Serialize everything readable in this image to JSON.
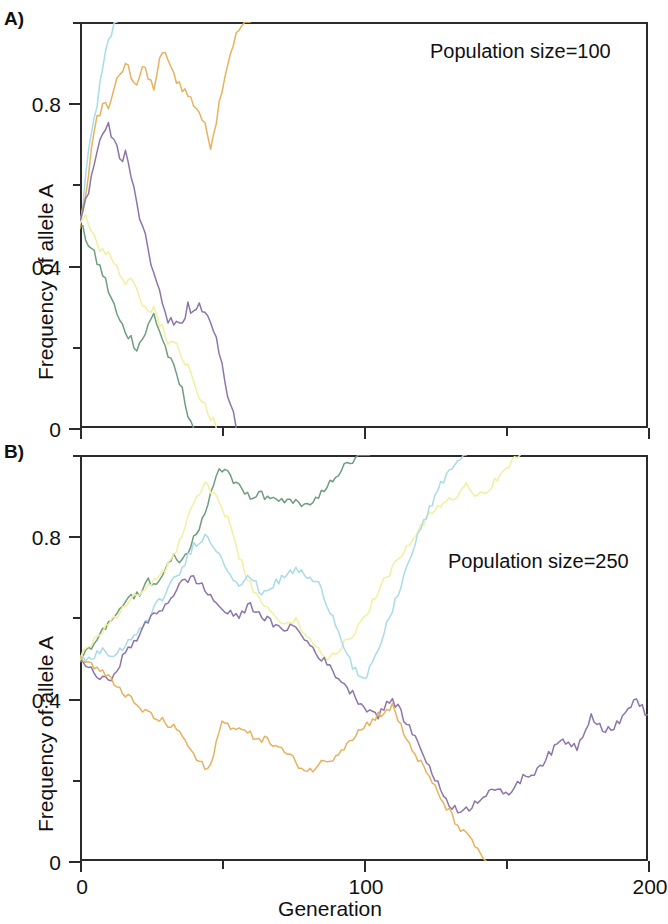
{
  "figure": {
    "panels": [
      {
        "id": "A",
        "panel_label": "A)",
        "annotation": "Population size=100",
        "ylabel": "Frequency of allele A"
      },
      {
        "id": "B",
        "panel_label": "B)",
        "annotation": "Population size=250",
        "ylabel": "Frequency of allele A"
      }
    ],
    "xlabel": "Generation"
  },
  "colors": {
    "orange": "#e8b25c",
    "cyan": "#a9dbe8",
    "purple": "#8c76a8",
    "yellow": "#f2f0a0",
    "green": "#6f9e7e",
    "axis": "#2b2b2b",
    "text": "#111111"
  },
  "chart_data": [
    {
      "type": "line",
      "panel": "A",
      "title": "Population size=100",
      "xlabel": "Generation",
      "ylabel": "Frequency of allele A",
      "xlim": [
        0,
        200
      ],
      "ylim": [
        0,
        1
      ],
      "xticks": [
        0,
        100,
        200
      ],
      "xtick_labels": [
        "0",
        "100",
        "200"
      ],
      "xminor_ticks": [
        50,
        150
      ],
      "yticks": [
        0,
        0.4,
        0.8
      ],
      "ytick_labels": [
        "0",
        "0.4",
        "0.8"
      ],
      "yminor_ticks": [
        0.2,
        0.6,
        1.0
      ],
      "grid": false,
      "legend": "none",
      "series": [
        {
          "name": "cyan",
          "color": "#a9dbe8",
          "fate": "fixed",
          "x": [
            0,
            1,
            2,
            3,
            4,
            5,
            6,
            7,
            8,
            9,
            10,
            11,
            12,
            13
          ],
          "y": [
            0.5,
            0.55,
            0.62,
            0.67,
            0.72,
            0.76,
            0.8,
            0.84,
            0.88,
            0.92,
            0.95,
            0.97,
            0.99,
            1.0
          ]
        },
        {
          "name": "orange",
          "color": "#e8b25c",
          "fate": "fixed",
          "x": [
            0,
            2,
            4,
            6,
            8,
            10,
            12,
            14,
            16,
            18,
            20,
            22,
            24,
            26,
            28,
            30,
            32,
            34,
            36,
            38,
            40,
            42,
            44,
            46,
            48,
            50,
            52,
            54,
            56,
            58,
            60
          ],
          "y": [
            0.5,
            0.58,
            0.68,
            0.76,
            0.8,
            0.79,
            0.84,
            0.86,
            0.9,
            0.87,
            0.85,
            0.89,
            0.86,
            0.84,
            0.9,
            0.93,
            0.88,
            0.86,
            0.84,
            0.82,
            0.8,
            0.78,
            0.74,
            0.7,
            0.76,
            0.84,
            0.9,
            0.95,
            0.98,
            1.0,
            1.0
          ]
        },
        {
          "name": "purple",
          "color": "#8c76a8",
          "fate": "lost",
          "x": [
            0,
            2,
            4,
            6,
            8,
            10,
            12,
            14,
            16,
            18,
            20,
            22,
            24,
            26,
            28,
            30,
            32,
            34,
            36,
            38,
            40,
            42,
            44,
            46,
            48,
            50,
            52,
            54,
            55
          ],
          "y": [
            0.5,
            0.56,
            0.62,
            0.68,
            0.73,
            0.74,
            0.71,
            0.66,
            0.68,
            0.62,
            0.55,
            0.49,
            0.44,
            0.38,
            0.33,
            0.28,
            0.26,
            0.27,
            0.25,
            0.3,
            0.28,
            0.31,
            0.29,
            0.25,
            0.21,
            0.15,
            0.09,
            0.04,
            0.0
          ]
        },
        {
          "name": "yellow",
          "color": "#f2f0a0",
          "fate": "lost",
          "x": [
            0,
            2,
            4,
            6,
            8,
            10,
            12,
            14,
            16,
            18,
            20,
            22,
            24,
            26,
            28,
            30,
            32,
            34,
            36,
            38,
            40,
            42,
            44,
            46,
            48
          ],
          "y": [
            0.5,
            0.52,
            0.48,
            0.45,
            0.44,
            0.43,
            0.41,
            0.38,
            0.36,
            0.38,
            0.33,
            0.3,
            0.28,
            0.3,
            0.26,
            0.23,
            0.21,
            0.22,
            0.18,
            0.15,
            0.11,
            0.08,
            0.05,
            0.03,
            0.0
          ]
        },
        {
          "name": "green",
          "color": "#6f9e7e",
          "fate": "lost",
          "x": [
            0,
            2,
            4,
            6,
            8,
            10,
            12,
            14,
            16,
            18,
            20,
            22,
            24,
            26,
            28,
            30,
            32,
            34,
            36,
            38,
            40
          ],
          "y": [
            0.5,
            0.47,
            0.44,
            0.41,
            0.38,
            0.34,
            0.3,
            0.26,
            0.24,
            0.22,
            0.2,
            0.22,
            0.25,
            0.28,
            0.24,
            0.2,
            0.16,
            0.13,
            0.09,
            0.04,
            0.0
          ]
        }
      ]
    },
    {
      "type": "line",
      "panel": "B",
      "title": "Population size=250",
      "xlabel": "Generation",
      "ylabel": "Frequency of allele A",
      "xlim": [
        0,
        200
      ],
      "ylim": [
        0,
        1
      ],
      "xticks": [
        0,
        100,
        200
      ],
      "xtick_labels": [
        "0",
        "100",
        "200"
      ],
      "xminor_ticks": [
        50,
        150
      ],
      "yticks": [
        0,
        0.4,
        0.8
      ],
      "ytick_labels": [
        "0",
        "0.4",
        "0.8"
      ],
      "yminor_ticks": [
        0.2,
        0.6,
        1.0
      ],
      "grid": false,
      "legend": "none",
      "series": [
        {
          "name": "green",
          "color": "#6f9e7e",
          "fate": "fixed",
          "x": [
            0,
            3,
            6,
            9,
            12,
            15,
            18,
            21,
            24,
            27,
            30,
            33,
            36,
            39,
            42,
            45,
            48,
            51,
            54,
            57,
            60,
            63,
            66,
            69,
            72,
            75,
            78,
            81,
            84,
            87,
            90,
            93,
            96,
            99,
            102
          ],
          "y": [
            0.5,
            0.52,
            0.55,
            0.58,
            0.6,
            0.63,
            0.65,
            0.66,
            0.69,
            0.68,
            0.72,
            0.75,
            0.74,
            0.78,
            0.82,
            0.88,
            0.95,
            0.97,
            0.93,
            0.92,
            0.9,
            0.91,
            0.89,
            0.9,
            0.88,
            0.89,
            0.87,
            0.88,
            0.9,
            0.92,
            0.95,
            0.97,
            0.98,
            1.0,
            1.0
          ]
        },
        {
          "name": "yellow",
          "color": "#f2f0a0",
          "fate": "fixed",
          "x": [
            0,
            4,
            8,
            12,
            16,
            20,
            24,
            28,
            32,
            36,
            40,
            44,
            48,
            52,
            56,
            60,
            64,
            68,
            72,
            76,
            80,
            84,
            88,
            92,
            96,
            100,
            104,
            108,
            112,
            116,
            120,
            124,
            128,
            132,
            136,
            140,
            144,
            148,
            152,
            155
          ],
          "y": [
            0.5,
            0.53,
            0.57,
            0.6,
            0.63,
            0.66,
            0.68,
            0.7,
            0.74,
            0.8,
            0.88,
            0.93,
            0.9,
            0.84,
            0.75,
            0.68,
            0.64,
            0.6,
            0.58,
            0.6,
            0.55,
            0.52,
            0.5,
            0.53,
            0.56,
            0.6,
            0.65,
            0.7,
            0.74,
            0.78,
            0.82,
            0.86,
            0.88,
            0.9,
            0.93,
            0.9,
            0.92,
            0.95,
            0.98,
            1.0
          ]
        },
        {
          "name": "cyan",
          "color": "#a9dbe8",
          "fate": "fixed",
          "x": [
            0,
            4,
            8,
            12,
            16,
            20,
            24,
            28,
            32,
            36,
            40,
            44,
            48,
            52,
            56,
            60,
            64,
            68,
            72,
            76,
            80,
            84,
            88,
            92,
            96,
            100,
            104,
            108,
            112,
            116,
            120,
            124,
            128,
            132,
            136
          ],
          "y": [
            0.5,
            0.5,
            0.52,
            0.5,
            0.53,
            0.56,
            0.6,
            0.64,
            0.68,
            0.72,
            0.78,
            0.8,
            0.77,
            0.72,
            0.68,
            0.7,
            0.66,
            0.68,
            0.7,
            0.72,
            0.7,
            0.68,
            0.62,
            0.55,
            0.48,
            0.44,
            0.5,
            0.58,
            0.66,
            0.74,
            0.82,
            0.88,
            0.94,
            0.98,
            1.0
          ]
        },
        {
          "name": "purple",
          "color": "#8c76a8",
          "fate": "segregating",
          "x": [
            0,
            5,
            10,
            15,
            20,
            25,
            30,
            35,
            40,
            45,
            50,
            55,
            60,
            65,
            70,
            75,
            80,
            85,
            90,
            95,
            100,
            105,
            110,
            115,
            120,
            125,
            130,
            135,
            140,
            145,
            150,
            155,
            160,
            165,
            170,
            175,
            180,
            185,
            190,
            195,
            200
          ],
          "y": [
            0.5,
            0.46,
            0.44,
            0.5,
            0.55,
            0.6,
            0.63,
            0.68,
            0.7,
            0.66,
            0.62,
            0.6,
            0.63,
            0.6,
            0.57,
            0.58,
            0.54,
            0.5,
            0.46,
            0.42,
            0.38,
            0.36,
            0.4,
            0.34,
            0.28,
            0.2,
            0.14,
            0.12,
            0.15,
            0.18,
            0.16,
            0.2,
            0.22,
            0.26,
            0.3,
            0.28,
            0.36,
            0.32,
            0.34,
            0.4,
            0.36
          ]
        },
        {
          "name": "orange",
          "color": "#e8b25c",
          "fate": "lost",
          "x": [
            0,
            5,
            10,
            15,
            20,
            25,
            30,
            35,
            40,
            45,
            50,
            55,
            60,
            65,
            70,
            75,
            80,
            85,
            90,
            95,
            100,
            105,
            110,
            115,
            120,
            125,
            130,
            135,
            140,
            143
          ],
          "y": [
            0.5,
            0.48,
            0.45,
            0.42,
            0.38,
            0.36,
            0.34,
            0.32,
            0.26,
            0.22,
            0.34,
            0.33,
            0.31,
            0.3,
            0.28,
            0.25,
            0.22,
            0.24,
            0.26,
            0.3,
            0.33,
            0.36,
            0.38,
            0.3,
            0.24,
            0.18,
            0.12,
            0.07,
            0.03,
            0.0
          ]
        }
      ]
    }
  ]
}
